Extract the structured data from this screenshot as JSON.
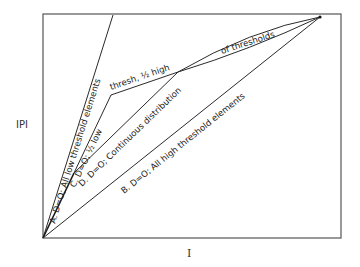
{
  "axes": {
    "y_label": "IPI",
    "x_label": "I"
  },
  "curves": [
    {
      "id": "A",
      "label": "A. D=O; All low threshold elements"
    },
    {
      "id": "C",
      "label_lower": "C. D=O; ½ low",
      "label_upper": "thresh, ½ high"
    },
    {
      "id": "D",
      "label_lower": "D. D=O; Continuous distribution",
      "label_upper": "of thresholds"
    },
    {
      "id": "B",
      "label": "B. D=O; All high threshold elements"
    }
  ],
  "colors": {
    "line": "#2a2a2a",
    "frame": "#555555",
    "background": "#ffffff"
  }
}
